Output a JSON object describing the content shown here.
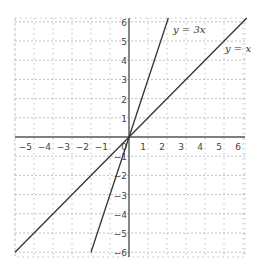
{
  "chart_data": {
    "type": "line",
    "title": "",
    "xlabel": "",
    "ylabel": "",
    "xlim": [
      -6,
      6.2
    ],
    "ylim": [
      -6.2,
      6.2
    ],
    "grid": true,
    "x_ticks": [
      -5,
      -4,
      -3,
      -2,
      -1,
      0,
      1,
      2,
      3,
      4,
      5,
      6
    ],
    "y_ticks": [
      -6,
      -5,
      -4,
      -3,
      -2,
      -1,
      1,
      2,
      3,
      4,
      5,
      6
    ],
    "series": [
      {
        "name": "y = 3x",
        "label": "y = 3x",
        "slope": 3,
        "x": [
          -2.0,
          2.07
        ],
        "y": [
          -6.0,
          6.2
        ]
      },
      {
        "name": "y = x",
        "label": "y = x",
        "slope": 1,
        "x": [
          -6.0,
          6.2
        ],
        "y": [
          -6.0,
          6.2
        ]
      }
    ],
    "annotations": [
      {
        "text": "y = 3x",
        "x": 2.4,
        "y": 5.6
      },
      {
        "text": "y = x",
        "x": 5.4,
        "y": 4.6
      }
    ]
  },
  "labels": {
    "line_3x": "y = 3x",
    "line_x": "y = x"
  },
  "colors": {
    "line": "#333333",
    "grid": "#b0b0b0",
    "axis": "#555555"
  }
}
